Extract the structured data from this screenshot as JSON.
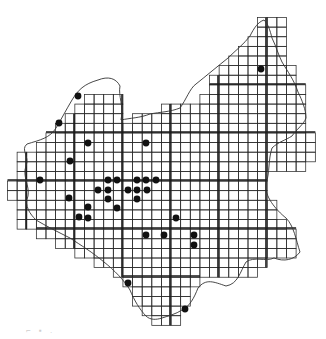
{
  "map": {
    "type": "grid-distribution-map",
    "background": "#ffffff",
    "ink_color": "#1a1a1a",
    "grid_line_color": "#2b2b2b",
    "dot_color": "#111111",
    "cell_size": 9.62,
    "origin_x": 7.5,
    "origin_y": 17.5,
    "rows": [
      {
        "row": 0,
        "cells": [
          [
            26,
            28
          ]
        ]
      },
      {
        "row": 1,
        "cells": [
          [
            26,
            28
          ]
        ]
      },
      {
        "row": 2,
        "cells": [
          [
            25,
            28
          ]
        ]
      },
      {
        "row": 3,
        "cells": [
          [
            24,
            28
          ]
        ]
      },
      {
        "row": 4,
        "cells": [
          [
            23,
            28
          ]
        ]
      },
      {
        "row": 5,
        "cells": [
          [
            22,
            29
          ]
        ]
      },
      {
        "row": 6,
        "cells": [
          [
            21,
            29
          ]
        ]
      },
      {
        "row": 7,
        "cells": [
          [
            21,
            30
          ]
        ]
      },
      {
        "row": 8,
        "cells": [
          [
            8,
            11
          ],
          [
            20,
            30
          ]
        ]
      },
      {
        "row": 9,
        "cells": [
          [
            7,
            11
          ],
          [
            16,
            30
          ]
        ]
      },
      {
        "row": 10,
        "cells": [
          [
            6,
            11
          ],
          [
            13,
            30
          ]
        ]
      },
      {
        "row": 11,
        "cells": [
          [
            5,
            30
          ]
        ]
      },
      {
        "row": 12,
        "cells": [
          [
            4,
            31
          ]
        ]
      },
      {
        "row": 13,
        "cells": [
          [
            3,
            31
          ]
        ]
      },
      {
        "row": 14,
        "cells": [
          [
            1,
            31
          ]
        ]
      },
      {
        "row": 15,
        "cells": [
          [
            1,
            30
          ]
        ]
      },
      {
        "row": 16,
        "cells": [
          [
            1,
            26
          ]
        ]
      },
      {
        "row": 17,
        "cells": [
          [
            0,
            26
          ]
        ]
      },
      {
        "row": 18,
        "cells": [
          [
            0,
            26
          ]
        ]
      },
      {
        "row": 19,
        "cells": [
          [
            1,
            27
          ]
        ]
      },
      {
        "row": 20,
        "cells": [
          [
            1,
            27
          ]
        ]
      },
      {
        "row": 21,
        "cells": [
          [
            1,
            28
          ]
        ]
      },
      {
        "row": 22,
        "cells": [
          [
            3,
            29
          ]
        ]
      },
      {
        "row": 23,
        "cells": [
          [
            5,
            29
          ]
        ]
      },
      {
        "row": 24,
        "cells": [
          [
            7,
            29
          ]
        ]
      },
      {
        "row": 25,
        "cells": [
          [
            9,
            26
          ]
        ]
      },
      {
        "row": 26,
        "cells": [
          [
            11,
            22
          ],
          [
            23,
            25
          ]
        ]
      },
      {
        "row": 27,
        "cells": [
          [
            12,
            19
          ]
        ]
      },
      {
        "row": 28,
        "cells": [
          [
            13,
            18
          ]
        ]
      },
      {
        "row": 29,
        "cells": [
          [
            13,
            18
          ]
        ]
      },
      {
        "row": 30,
        "cells": [
          [
            14,
            17
          ]
        ]
      },
      {
        "row": 31,
        "cells": [
          [
            15,
            17
          ]
        ]
      }
    ],
    "thick_lines_x": [
      26,
      74,
      122,
      170,
      218,
      266
    ],
    "thick_lines_y": [
      84,
      132,
      180,
      228,
      276
    ],
    "dots": [
      {
        "x": 78,
        "y": 96
      },
      {
        "x": 59,
        "y": 123
      },
      {
        "x": 88,
        "y": 143
      },
      {
        "x": 146,
        "y": 143
      },
      {
        "x": 70,
        "y": 161
      },
      {
        "x": 261,
        "y": 69
      },
      {
        "x": 40,
        "y": 180
      },
      {
        "x": 108,
        "y": 180
      },
      {
        "x": 117,
        "y": 180
      },
      {
        "x": 137,
        "y": 180
      },
      {
        "x": 146,
        "y": 180
      },
      {
        "x": 156,
        "y": 180
      },
      {
        "x": 98,
        "y": 190
      },
      {
        "x": 108,
        "y": 190
      },
      {
        "x": 128,
        "y": 190
      },
      {
        "x": 137,
        "y": 190
      },
      {
        "x": 147,
        "y": 190
      },
      {
        "x": 69,
        "y": 198
      },
      {
        "x": 108,
        "y": 199
      },
      {
        "x": 137,
        "y": 199
      },
      {
        "x": 88,
        "y": 207
      },
      {
        "x": 117,
        "y": 208
      },
      {
        "x": 79,
        "y": 217
      },
      {
        "x": 88,
        "y": 218
      },
      {
        "x": 176,
        "y": 218
      },
      {
        "x": 146,
        "y": 235
      },
      {
        "x": 164,
        "y": 235
      },
      {
        "x": 194,
        "y": 235
      },
      {
        "x": 194,
        "y": 245
      },
      {
        "x": 128,
        "y": 283
      },
      {
        "x": 185,
        "y": 309
      }
    ],
    "dot_radius": 3.4,
    "border_path": "M27,144 C40,140 50,138 56,128 C62,118 66,110 72,100 C78,90 84,84 98,80 C108,76 116,78 120,86 C118,96 124,106 121,120 C130,118 140,118 150,114 C160,112 170,112 180,108 C186,100 190,88 196,84 C206,76 218,66 228,58 C236,50 244,44 250,36 C254,28 258,22 264,20 C268,24 270,30 272,38 C276,46 278,54 282,62 C288,72 294,80 298,92 C302,100 306,110 306,118 C304,124 296,130 292,136 C286,140 278,142 272,148 C268,160 270,172 266,184 C264,196 276,210 286,218 C294,226 296,240 300,252 C294,260 284,262 274,258 C266,262 254,256 246,262 C240,272 238,284 226,286 C214,282 206,278 198,288 C194,298 190,306 182,310 C176,314 168,316 162,318 C156,320 150,320 146,316 C140,310 134,300 130,290 C124,280 114,270 104,262 C92,252 82,246 70,238 C58,232 46,226 36,220 C30,214 24,206 28,196 C30,186 22,176 26,166 C30,156 20,150 27,144 Z"
  },
  "caption": {
    "text": "⌐ ▪ ."
  }
}
